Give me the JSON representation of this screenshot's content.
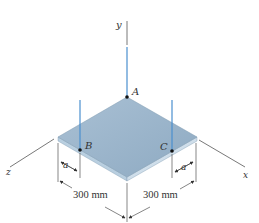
{
  "figure": {
    "axes": {
      "x": "x",
      "y": "y",
      "z": "z"
    },
    "points": {
      "A": "A",
      "B": "B",
      "C": "C"
    },
    "dimensions": {
      "a_left": "a",
      "a_right": "a",
      "left_length": "300 mm",
      "right_length": "300 mm"
    },
    "colors": {
      "plate_top": "#9db6cc",
      "plate_edge": "#c6d8e6",
      "cable": "#4a8fcf",
      "line": "#444444"
    }
  }
}
